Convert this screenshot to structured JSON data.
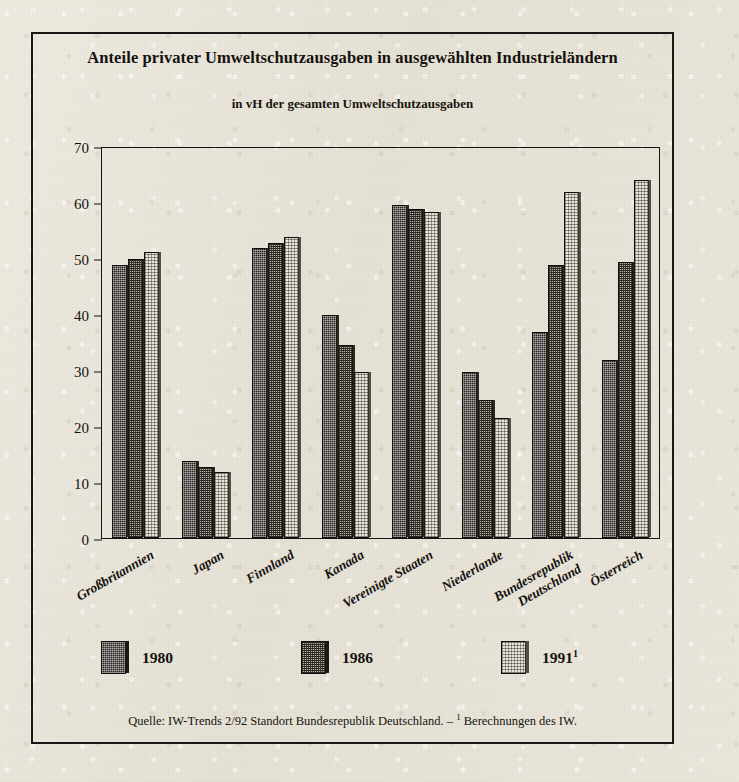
{
  "figure": {
    "title": "Anteile privater Umweltschutzausgaben in ausgewählten Industrieländern",
    "subtitle": "in vH der gesamten Umweltschutzausgaben",
    "source_prefix": "Quelle: IW-Trends 2/92 Standort Bundesrepublik Deutschland. – ",
    "source_footnote_marker": "1",
    "source_suffix": " Berechnungen des IW.",
    "frame_color": "#1a1714",
    "paper_color": "#e9e5da"
  },
  "legend": {
    "items": [
      {
        "label": "1980",
        "marker": "",
        "swatch": "dark-hatched",
        "color": "#241f1b"
      },
      {
        "label": "1986",
        "marker": "",
        "swatch": "medium-hatched",
        "color": "#b9b3a6"
      },
      {
        "label": "1991",
        "marker": "1",
        "swatch": "light-hatched",
        "color": "#eae6dc"
      }
    ]
  },
  "axis": {
    "y_ticks": [
      "0",
      "10",
      "20",
      "30",
      "40",
      "50",
      "60",
      "70"
    ],
    "y_min": 0,
    "y_max": 70
  },
  "chart_data": {
    "type": "bar",
    "title": "Anteile privater Umweltschutzausgaben in ausgewählten Industrieländern",
    "subtitle": "in vH der gesamten Umweltschutzausgaben",
    "xlabel": "",
    "ylabel": "in vH der gesamten Umweltschutzausgaben",
    "ylim": [
      0,
      70
    ],
    "ytick_step": 10,
    "grid": false,
    "legend_position": "bottom",
    "categories": [
      "Großbritannien",
      "Japan",
      "Finnland",
      "Kanada",
      "Vereinigte Staaten",
      "Niederlande",
      "Bundesrepublik\nDeutschland",
      "Österreich"
    ],
    "series": [
      {
        "name": "1980",
        "values": [
          48.7,
          13.7,
          51.8,
          39.8,
          59.4,
          29.6,
          36.8,
          31.7
        ]
      },
      {
        "name": "1986",
        "values": [
          49.8,
          12.6,
          52.6,
          34.5,
          58.8,
          24.6,
          48.7,
          49.3
        ]
      },
      {
        "name": "1991",
        "values": [
          51.0,
          11.8,
          53.7,
          29.6,
          58.2,
          21.5,
          61.7,
          63.9
        ]
      }
    ]
  }
}
